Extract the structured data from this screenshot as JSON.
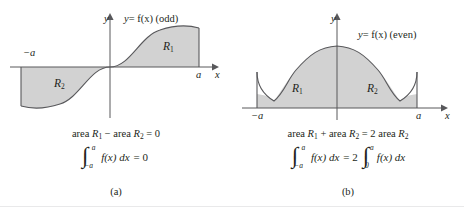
{
  "figure": {
    "background": "#ffffff",
    "fill_color": "#d2d2d2",
    "stroke_color": "#58585b",
    "text_color": "#231f20"
  },
  "panels": [
    {
      "id": "a",
      "sub_caption": "(a)",
      "curve_label": "y = f(x) (odd)",
      "curve_label_y": "y",
      "curve_label_eq": "= f(x) (odd)",
      "axis_y_label": "y",
      "axis_x_label": "x",
      "tick_left": "−a",
      "tick_right": "a",
      "regions": [
        {
          "name": "R",
          "sub": "1"
        },
        {
          "name": "R",
          "sub": "2"
        }
      ],
      "area_statement": {
        "prefix": "area ",
        "r1": "R",
        "r1_sub": "1",
        "operator": " − area ",
        "r2": "R",
        "r2_sub": "2",
        "result": " = 0"
      },
      "equation": {
        "integral_lower": "−a",
        "integral_upper": "a",
        "integrand": "f(x) dx",
        "relation": "= 0",
        "has_second_integral": false
      }
    },
    {
      "id": "b",
      "sub_caption": "(b)",
      "curve_label": "y = f(x) (even)",
      "curve_label_y": "y",
      "curve_label_eq": "= f(x) (even)",
      "axis_y_label": "y",
      "axis_x_label": "x",
      "tick_left": "−a",
      "tick_right": "a",
      "regions": [
        {
          "name": "R",
          "sub": "1"
        },
        {
          "name": "R",
          "sub": "2"
        }
      ],
      "area_statement": {
        "prefix": "area ",
        "r1": "R",
        "r1_sub": "1",
        "operator": " + area ",
        "r2": "R",
        "r2_sub": "2",
        "result": " = 2 area ",
        "r3": "R",
        "r3_sub": "2"
      },
      "equation": {
        "integral_lower": "−a",
        "integral_upper": "a",
        "integrand": "f(x) dx",
        "relation": "= 2",
        "has_second_integral": true,
        "integral2_lower": "0",
        "integral2_upper": "a",
        "integrand2": "f(x) dx"
      }
    }
  ]
}
